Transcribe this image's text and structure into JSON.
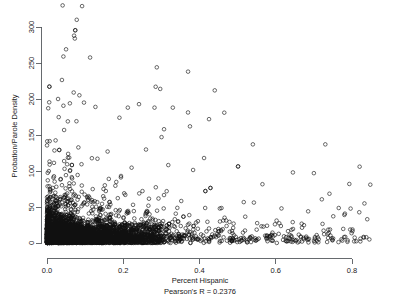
{
  "chart_data": {
    "type": "scatter",
    "title": "",
    "xlabel": "Percent Hispanic",
    "ylabel": "Probation/Parole Density",
    "subtitle": "Pearson's R = 0.2376",
    "pearson_r": 0.2376,
    "xlim": [
      -0.02,
      0.87
    ],
    "ylim": [
      -8,
      335
    ],
    "xticks": [
      0.0,
      0.2,
      0.4,
      0.6,
      0.8
    ],
    "xtick_labels": [
      "0.0",
      "0.2",
      "0.4",
      "0.6",
      "0.8"
    ],
    "yticks": [
      0,
      50,
      100,
      150,
      200,
      250,
      300
    ],
    "ytick_labels": [
      "0",
      "50",
      "100",
      "150",
      "200",
      "250",
      "300"
    ],
    "grid": false,
    "legend": false,
    "marker": "open-circle",
    "marker_radius_px": 1.8,
    "marker_color": "#111111",
    "n_points": 3000,
    "series": [
      {
        "name": "counties",
        "description": "Percent Hispanic vs Probation/Parole Density, heavy density near origin, long right tail",
        "notable_points": [
          {
            "x": 0.041,
            "y": 330
          },
          {
            "x": 0.092,
            "y": 329
          },
          {
            "x": 0.078,
            "y": 310
          },
          {
            "x": 0.071,
            "y": 288
          },
          {
            "x": 0.073,
            "y": 284
          },
          {
            "x": 0.05,
            "y": 269
          },
          {
            "x": 0.043,
            "y": 259
          },
          {
            "x": 0.288,
            "y": 244
          },
          {
            "x": 0.37,
            "y": 238
          },
          {
            "x": 0.285,
            "y": 217
          },
          {
            "x": 0.297,
            "y": 214
          },
          {
            "x": 0.44,
            "y": 212
          },
          {
            "x": 0.07,
            "y": 209
          },
          {
            "x": 0.029,
            "y": 200
          },
          {
            "x": 0.097,
            "y": 195
          },
          {
            "x": 0.06,
            "y": 194
          },
          {
            "x": 0.127,
            "y": 189
          },
          {
            "x": 0.212,
            "y": 188
          },
          {
            "x": 0.282,
            "y": 188
          },
          {
            "x": 0.33,
            "y": 188
          },
          {
            "x": 0.465,
            "y": 181
          },
          {
            "x": 0.19,
            "y": 174
          },
          {
            "x": 0.425,
            "y": 172
          },
          {
            "x": 0.375,
            "y": 162
          },
          {
            "x": 0.307,
            "y": 158
          },
          {
            "x": 0.54,
            "y": 137
          },
          {
            "x": 0.73,
            "y": 137
          },
          {
            "x": 0.412,
            "y": 118
          },
          {
            "x": 0.82,
            "y": 106
          },
          {
            "x": 0.645,
            "y": 98
          },
          {
            "x": 0.7,
            "y": 97
          },
          {
            "x": 0.793,
            "y": 82
          },
          {
            "x": 0.848,
            "y": 81
          },
          {
            "x": 0.615,
            "y": 48
          },
          {
            "x": 0.685,
            "y": 44
          },
          {
            "x": 0.78,
            "y": 39
          },
          {
            "x": 0.84,
            "y": 33
          }
        ]
      }
    ]
  },
  "axes": {
    "x_axis_name": "x-axis",
    "y_axis_name": "y-axis"
  }
}
